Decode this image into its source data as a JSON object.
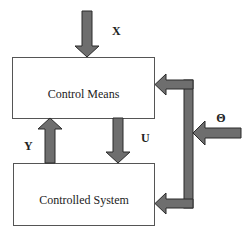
{
  "diagram": {
    "blocks": [
      {
        "id": "control-means",
        "label": "Control Means"
      },
      {
        "id": "controlled-system",
        "label": "Controlled System"
      }
    ],
    "signals": {
      "x": "X",
      "u": "U",
      "y": "Y",
      "theta": "Θ"
    },
    "colors": {
      "arrow_fill": "#6e6e6e",
      "arrow_stroke": "#2a2a2a",
      "box_stroke": "#555555",
      "box_fill": "#ffffff"
    }
  }
}
